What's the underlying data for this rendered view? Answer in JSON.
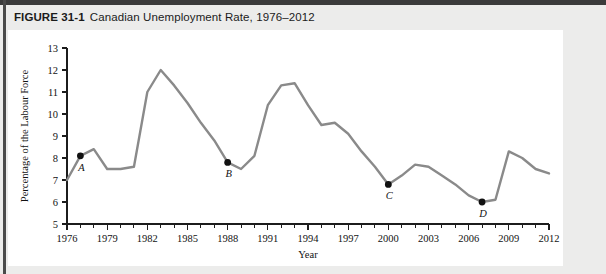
{
  "figure": {
    "number": "FIGURE 31-1",
    "caption": "Canadian Unemployment Rate, 1976–2012"
  },
  "chart_data": {
    "type": "line",
    "title": "Canadian Unemployment Rate, 1976–2012",
    "xlabel": "Year",
    "ylabel": "Percentage of the Labour Force",
    "xlim": [
      1976,
      2012
    ],
    "ylim": [
      5,
      13
    ],
    "ytick_labels": [
      "5",
      "6",
      "7",
      "8",
      "9",
      "10",
      "11",
      "12",
      "13"
    ],
    "yticks": [
      5,
      6,
      7,
      8,
      9,
      10,
      11,
      12,
      13
    ],
    "xtick_labels": [
      "1976",
      "1979",
      "1982",
      "1985",
      "1988",
      "1991",
      "1994",
      "1997",
      "2000",
      "2003",
      "2006",
      "2009",
      "2012"
    ],
    "xticks": [
      1976,
      1979,
      1982,
      1985,
      1988,
      1991,
      1994,
      1997,
      2000,
      2003,
      2006,
      2009,
      2012
    ],
    "x_minor_tick_step": 1,
    "grid": false,
    "legend": "none",
    "series": [
      {
        "name": "Unemployment rate",
        "color": "#8a8a8a",
        "x": [
          1976,
          1977,
          1978,
          1979,
          1980,
          1981,
          1982,
          1983,
          1984,
          1985,
          1986,
          1987,
          1988,
          1989,
          1990,
          1991,
          1992,
          1993,
          1994,
          1995,
          1996,
          1997,
          1998,
          1999,
          2000,
          2001,
          2002,
          2003,
          2004,
          2005,
          2006,
          2007,
          2008,
          2009,
          2010,
          2011,
          2012
        ],
        "values": [
          7.0,
          8.1,
          8.4,
          7.5,
          7.5,
          7.6,
          11.0,
          12.0,
          11.3,
          10.5,
          9.6,
          8.8,
          7.8,
          7.5,
          8.1,
          10.4,
          11.3,
          11.4,
          10.4,
          9.5,
          9.6,
          9.1,
          8.3,
          7.6,
          6.8,
          7.2,
          7.7,
          7.6,
          7.2,
          6.8,
          6.3,
          6.0,
          6.1,
          8.3,
          8.0,
          7.5,
          7.3
        ]
      }
    ],
    "annotations": [
      {
        "label": "A",
        "x": 1977,
        "y": 8.1
      },
      {
        "label": "B",
        "x": 1988,
        "y": 7.8
      },
      {
        "label": "C",
        "x": 2000,
        "y": 6.8
      },
      {
        "label": "D",
        "x": 2007,
        "y": 6.0
      }
    ]
  }
}
